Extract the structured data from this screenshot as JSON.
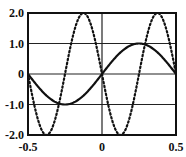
{
  "chart_data": {
    "type": "line",
    "title": "",
    "xlabel": "",
    "ylabel": "",
    "xlim": [
      -0.5,
      0.5
    ],
    "ylim": [
      -2.0,
      2.0
    ],
    "grid": {
      "horizontal": [
        -1.0,
        0,
        1.0
      ],
      "vertical": [
        0
      ]
    },
    "x_ticks": [
      "-0.5",
      "0",
      "0.5"
    ],
    "y_ticks": [
      "2.0",
      "1.0",
      "0",
      "-1.0",
      "-2.0"
    ],
    "series": [
      {
        "name": "solid",
        "style": "solid",
        "formula": "sin(2*pi*x)",
        "amplitude": 1.0,
        "period": 1.0,
        "x": [
          -0.5,
          -0.375,
          -0.25,
          -0.125,
          0,
          0.125,
          0.25,
          0.375,
          0.5
        ],
        "values": [
          0,
          -0.71,
          -1.0,
          -0.71,
          0,
          0.71,
          1.0,
          0.71,
          0
        ]
      },
      {
        "name": "dotted",
        "style": "dotted",
        "formula": "-2*sin(4*pi*x)",
        "amplitude": 2.0,
        "period": 0.5,
        "x": [
          -0.5,
          -0.375,
          -0.25,
          -0.125,
          0,
          0.125,
          0.25,
          0.375,
          0.5
        ],
        "values": [
          0,
          -2.0,
          0,
          2.0,
          0,
          -2.0,
          0,
          2.0,
          0
        ]
      }
    ]
  }
}
